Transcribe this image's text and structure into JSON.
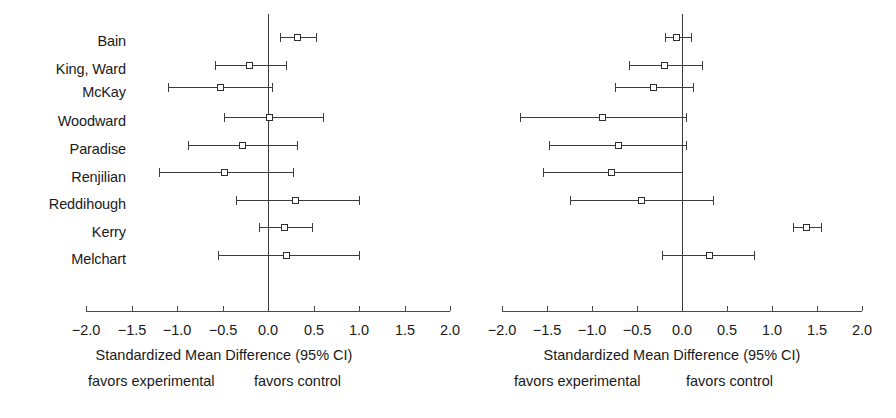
{
  "figure": {
    "type": "forest-plot-pair",
    "background": "#ffffff",
    "marker_color": "#2e2e2e",
    "line_color": "#3c3c3c"
  },
  "studies": [
    "Bain",
    "King, Ward",
    "McKay",
    "Woodward",
    "Paradise",
    "Renjilian",
    "Reddihough",
    "Kerry",
    "Melchart"
  ],
  "axis": {
    "ticks": [
      -2.0,
      -1.5,
      -1.0,
      -0.5,
      0.0,
      0.5,
      1.0,
      1.5,
      2.0
    ],
    "tick_labels": [
      "−2.0",
      "−1.5",
      "−1.0",
      "−0.5",
      "0.0",
      "0.5",
      "1.0",
      "1.5",
      "2.0"
    ],
    "min": -2.0,
    "max": 2.0,
    "reference_line": 0.0
  },
  "caption": {
    "title": "Standardized Mean Difference (95% CI)",
    "left_hint": "favors experimental",
    "right_hint": "favors control"
  },
  "chart_data": [
    {
      "type": "scatter",
      "panel": "left",
      "title": "Standardized Mean Difference (95% CI)",
      "xlabel": "Standardized Mean Difference (95% CI)",
      "ylabel": "",
      "xlim": [
        -2.0,
        2.0
      ],
      "grid": false,
      "legend": "none",
      "categories": [
        "Bain",
        "King, Ward",
        "McKay",
        "Woodward",
        "Paradise",
        "Renjilian",
        "Reddihough",
        "Kerry",
        "Melchart"
      ],
      "values": [
        0.32,
        -0.2,
        -0.52,
        0.02,
        -0.28,
        -0.48,
        0.3,
        0.18,
        0.2
      ],
      "ci_lower": [
        0.13,
        -0.58,
        -1.1,
        -0.48,
        -0.88,
        -1.2,
        -0.35,
        -0.1,
        -0.55
      ],
      "ci_upper": [
        0.53,
        0.2,
        0.04,
        0.6,
        0.32,
        0.28,
        1.0,
        0.48,
        1.0
      ],
      "annotations": [
        "favors experimental",
        "favors control"
      ]
    },
    {
      "type": "scatter",
      "panel": "right",
      "title": "Standardized Mean Difference (95% CI)",
      "xlabel": "Standardized Mean Difference (95% CI)",
      "ylabel": "",
      "xlim": [
        -2.0,
        2.0
      ],
      "grid": false,
      "legend": "none",
      "categories": [
        "Bain",
        "King, Ward",
        "McKay",
        "Woodward",
        "Paradise",
        "Renjilian",
        "Reddihough",
        "Kerry",
        "Melchart"
      ],
      "values": [
        -0.06,
        -0.19,
        -0.32,
        -0.88,
        -0.71,
        -0.78,
        -0.45,
        1.38,
        0.3
      ],
      "ci_lower": [
        -0.19,
        -0.59,
        -0.75,
        -1.8,
        -1.48,
        -1.54,
        -1.24,
        1.23,
        -0.22
      ],
      "ci_upper": [
        0.1,
        0.22,
        0.12,
        0.04,
        0.04,
        0.0,
        0.34,
        1.54,
        0.8
      ],
      "annotations": [
        "favors experimental",
        "favors control"
      ]
    }
  ]
}
